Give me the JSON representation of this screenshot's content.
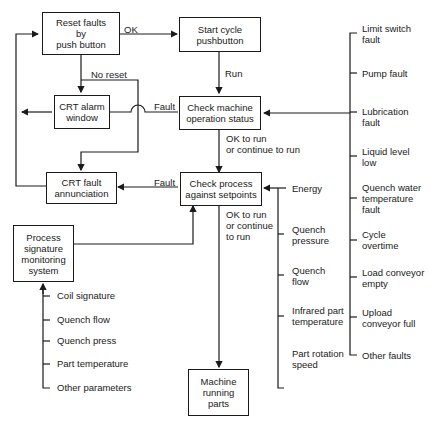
{
  "boxes": {
    "reset": "Reset faults\nby\npush button",
    "start": "Start cycle\npushbutton",
    "alarm": "CRT alarm\nwindow",
    "machine": "Check machine\noperation status",
    "annunciation": "CRT fault\nannunciation",
    "process": "Check process\nagainst setpoints",
    "signature": "Process\nsignature\nmonitoring\nsystem",
    "running": "Machine\nrunning\nparts"
  },
  "edge_labels": {
    "ok": "OK",
    "run": "Run",
    "no_reset": "No reset",
    "fault1": "Fault",
    "fault2": "Fault",
    "ok_run1": "OK to run\nor continue to run",
    "ok_run2": "OK to run\nor continue\nto run"
  },
  "machine_faults": [
    "Limit switch\nfault",
    "Pump fault",
    "Lubrication\nfault",
    "Liquid level\nlow",
    "Quench water\ntemperature\nfault",
    "Cycle\novertime",
    "Load conveyor\nempty",
    "Upload\nconveyor full",
    "Other faults"
  ],
  "setpoints": [
    "Energy",
    "Quench\npressure",
    "Quench\nflow",
    "Infrared part\ntemperature",
    "Part rotation\nspeed"
  ],
  "signature_params": [
    "Coil signature",
    "Quench flow",
    "Quench press",
    "Part temperature",
    "Other parameters"
  ]
}
